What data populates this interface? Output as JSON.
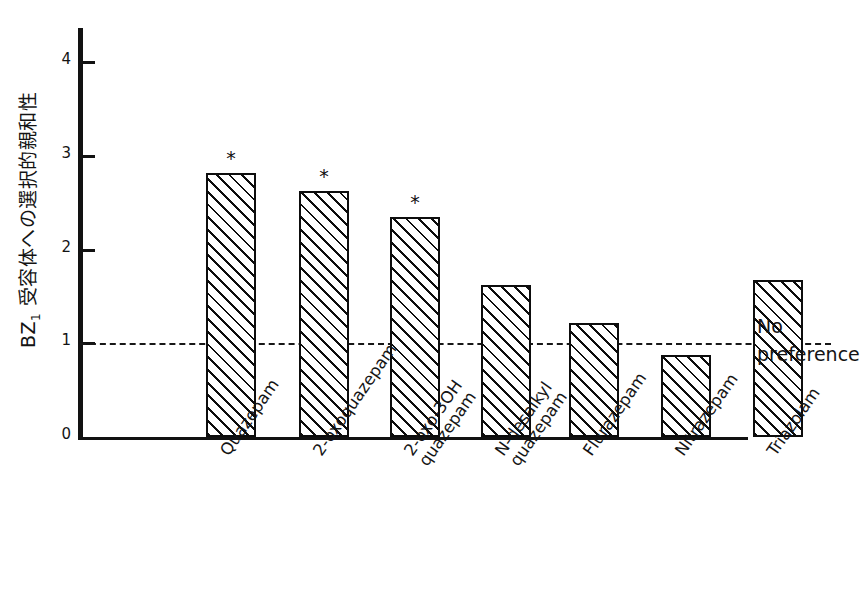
{
  "chart_data": {
    "type": "bar",
    "title": "",
    "xlabel": "",
    "ylabel": "BZ1 受容体への選択的親和性",
    "ylabel_main": "BZ",
    "ylabel_sub": "1",
    "ylabel_rest": " 受容体への選択的親和性",
    "ylim": [
      0,
      4.35
    ],
    "yticks": [
      0,
      1,
      2,
      3,
      4
    ],
    "ytick_labels": [
      "0",
      "1",
      "2",
      "3",
      "4"
    ],
    "grid": false,
    "legend": "none",
    "categories": [
      "Quazepam",
      "2-oxoquazepam",
      "2-oxo-3OH\nquazepam",
      "N-desalkyl\nquazepam",
      "Flurazepam",
      "Nitrazepam",
      "Triazolam"
    ],
    "values": [
      2.82,
      2.62,
      2.35,
      1.62,
      1.22,
      0.87,
      1.68
    ],
    "significance_markers": [
      "*",
      "*",
      "*",
      "",
      "",
      "",
      ""
    ],
    "reference_line": {
      "value": 1,
      "style": "dashed",
      "label_line1": "No",
      "label_line2": "preference"
    },
    "bar_style": {
      "fill": "diagonal-hatch",
      "edge_color": "#0d0d0d",
      "face_color": "#ffffff"
    }
  },
  "annotation": {
    "line1": "No",
    "line2": "preference"
  }
}
